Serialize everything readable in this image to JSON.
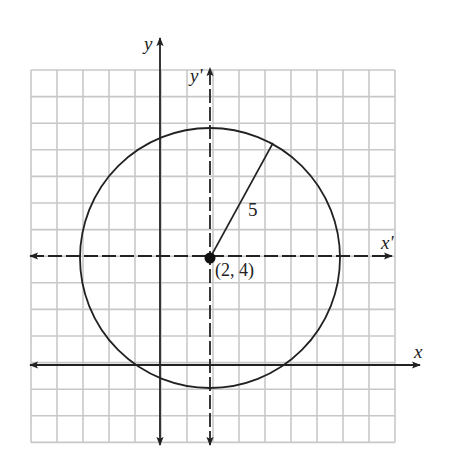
{
  "figure": {
    "grid": {
      "left": 31,
      "top": 70,
      "cols": 14,
      "rows": 14,
      "cell_w": 26.0,
      "cell_h": 26.6,
      "color": "#c8c8c8"
    },
    "axes": {
      "y": {
        "label": "y",
        "x": 160,
        "top": 38,
        "bottom": 445
      },
      "y_prime": {
        "label": "y'",
        "x": 210,
        "top": 68,
        "bottom": 445
      },
      "x_prime": {
        "label": "x'",
        "y": 256,
        "left": 30,
        "right": 392
      },
      "x": {
        "label": "x",
        "y": 365,
        "left": 30,
        "right": 420
      }
    },
    "circle": {
      "cx": 210,
      "cy": 258,
      "r": 130,
      "color": "#222222"
    },
    "center": {
      "label": "(2, 4)"
    },
    "radius": {
      "label": "5",
      "end_x": 273,
      "end_y": 143
    },
    "ink_color": "#222222"
  }
}
